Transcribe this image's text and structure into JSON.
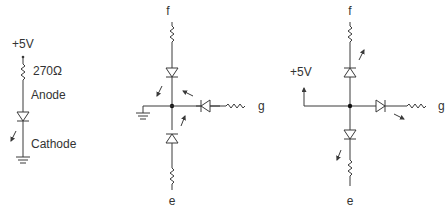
{
  "circuit1": {
    "supply": "+5V",
    "resistor": "270Ω",
    "anode": "Anode",
    "cathode": "Cathode"
  },
  "circuit2": {
    "label_top": "f",
    "label_right": "g",
    "label_bottom": "e",
    "type": "common cathode"
  },
  "circuit3": {
    "supply": "+5V",
    "label_top": "f",
    "label_right": "g",
    "label_bottom": "e",
    "type": "common anode"
  }
}
